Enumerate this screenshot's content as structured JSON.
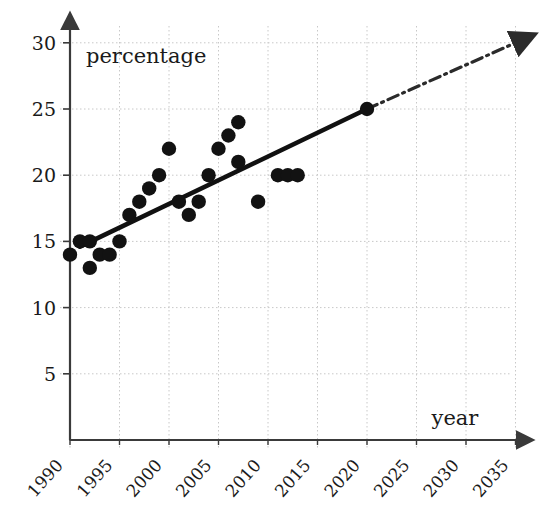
{
  "chart_data": {
    "type": "scatter",
    "title": "",
    "subtitle": "",
    "xlabel": "year",
    "ylabel": "percentage",
    "xlim": [
      1989,
      2036
    ],
    "ylim": [
      0,
      30
    ],
    "xticks": [
      1990,
      1995,
      2000,
      2005,
      2010,
      2015,
      2020,
      2025,
      2030,
      2035
    ],
    "xtick_labels": [
      "1990",
      "1995",
      "2000",
      "2005",
      "2010",
      "2015",
      "2020",
      "2025",
      "2030",
      "2035"
    ],
    "yticks": [
      5,
      10,
      15,
      20,
      25,
      30
    ],
    "ytick_labels": [
      "5",
      "10",
      "15",
      "20",
      "25",
      "30"
    ],
    "grid": true,
    "legend": null,
    "series": [
      {
        "name": "observations",
        "type": "scatter",
        "marker": "filled-circle",
        "color": "#121212",
        "points": [
          {
            "x": 1990,
            "y": 14
          },
          {
            "x": 1991,
            "y": 15
          },
          {
            "x": 1992,
            "y": 15
          },
          {
            "x": 1992,
            "y": 13
          },
          {
            "x": 1993,
            "y": 14
          },
          {
            "x": 1994,
            "y": 14
          },
          {
            "x": 1995,
            "y": 15
          },
          {
            "x": 1996,
            "y": 17
          },
          {
            "x": 1997,
            "y": 18
          },
          {
            "x": 1998,
            "y": 19
          },
          {
            "x": 1999,
            "y": 20
          },
          {
            "x": 2000,
            "y": 22
          },
          {
            "x": 2001,
            "y": 18
          },
          {
            "x": 2002,
            "y": 17
          },
          {
            "x": 2003,
            "y": 18
          },
          {
            "x": 2004,
            "y": 20
          },
          {
            "x": 2005,
            "y": 22
          },
          {
            "x": 2006,
            "y": 23
          },
          {
            "x": 2007,
            "y": 24
          },
          {
            "x": 2007,
            "y": 21
          },
          {
            "x": 2009,
            "y": 18
          },
          {
            "x": 2011,
            "y": 20
          },
          {
            "x": 2012,
            "y": 20
          },
          {
            "x": 2013,
            "y": 20
          }
        ]
      },
      {
        "name": "trend-line",
        "type": "line",
        "style": "solid",
        "color": "#111111",
        "points": [
          {
            "x": 1991,
            "y": 14.6
          },
          {
            "x": 2020,
            "y": 25
          }
        ]
      },
      {
        "name": "projection",
        "type": "line",
        "style": "dash-dot",
        "arrow": true,
        "color": "#2b2b2b",
        "points": [
          {
            "x": 2020,
            "y": 25
          },
          {
            "x": 2035,
            "y": 30
          }
        ]
      }
    ],
    "annotations": [
      {
        "name": "endpoint-marker",
        "x": 2020,
        "y": 25,
        "marker": "filled-circle"
      }
    ]
  },
  "axes": {
    "y_axis_title": "percentage",
    "x_axis_title": "year"
  }
}
